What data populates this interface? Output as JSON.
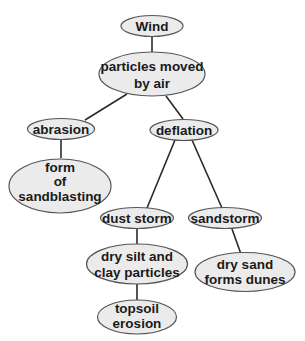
{
  "diagram": {
    "type": "concept-map",
    "colors": {
      "node_fill": "#ebebeb",
      "node_stroke": "#555555",
      "edge": "#2a2a2a",
      "text": "#1a1a1a"
    },
    "nodes": [
      {
        "id": "wind",
        "lines": [
          "Wind"
        ]
      },
      {
        "id": "particles",
        "lines": [
          "particles moved",
          "by air"
        ]
      },
      {
        "id": "abrasion",
        "lines": [
          "abrasion"
        ]
      },
      {
        "id": "deflation",
        "lines": [
          "deflation"
        ]
      },
      {
        "id": "sandblasting",
        "lines": [
          "form",
          "of",
          "sandblasting"
        ]
      },
      {
        "id": "dust_storm",
        "lines": [
          "dust storm"
        ]
      },
      {
        "id": "sandstorm",
        "lines": [
          "sandstorm"
        ]
      },
      {
        "id": "dry_silt",
        "lines": [
          "dry silt and",
          "clay particles"
        ]
      },
      {
        "id": "dry_sand",
        "lines": [
          "dry sand",
          "forms dunes"
        ]
      },
      {
        "id": "topsoil",
        "lines": [
          "topsoil",
          "erosion"
        ]
      }
    ],
    "edges": [
      [
        "wind",
        "particles"
      ],
      [
        "particles",
        "abrasion"
      ],
      [
        "particles",
        "deflation"
      ],
      [
        "abrasion",
        "sandblasting"
      ],
      [
        "deflation",
        "dust_storm"
      ],
      [
        "deflation",
        "sandstorm"
      ],
      [
        "dust_storm",
        "dry_silt"
      ],
      [
        "sandstorm",
        "dry_sand"
      ],
      [
        "dry_silt",
        "topsoil"
      ]
    ]
  }
}
